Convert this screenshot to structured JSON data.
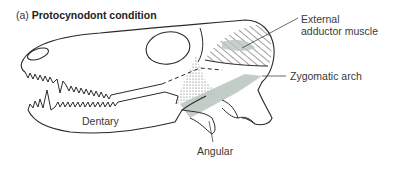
{
  "figure": {
    "panel_label": "(a)",
    "title": "Protocynodont condition"
  },
  "labels": {
    "external_adductor_line1": "External",
    "external_adductor_line2": "adductor muscle",
    "zygomatic_arch": "Zygomatic arch",
    "dentary": "Dentary",
    "angular": "Angular"
  },
  "colors": {
    "line": "#2a2a2a",
    "muscle_fill": "#b9c4bd",
    "stipple": "#555555",
    "leader": "#444444"
  }
}
